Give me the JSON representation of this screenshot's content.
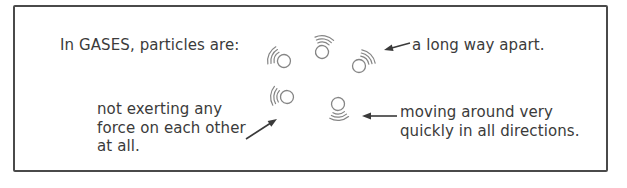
{
  "figure": {
    "title": "In GASES, particles are:",
    "labels": {
      "apart": "a long way apart.",
      "force": "not exerting any\nforce on each other\nat all.",
      "moving": "moving around very\nquickly in all directions."
    }
  },
  "colors": {
    "border": "#4a4a4a",
    "text": "#3b3b3b",
    "particle": "#858585",
    "arrow": "#3a3a3a"
  },
  "diagram": {
    "particle_radius": 6.5,
    "arc_radii": [
      10,
      13.2,
      16.4
    ],
    "particles": [
      {
        "name": "gas-particle-1",
        "cx": 284,
        "cy": 61,
        "rotation": 25
      },
      {
        "name": "gas-particle-2",
        "cx": 322,
        "cy": 52,
        "rotation": 100
      },
      {
        "name": "gas-particle-3",
        "cx": 359,
        "cy": 66,
        "rotation": 135
      },
      {
        "name": "gas-particle-4",
        "cx": 287,
        "cy": 97,
        "rotation": 5
      },
      {
        "name": "gas-particle-5",
        "cx": 338,
        "cy": 104,
        "rotation": 265
      }
    ],
    "arrows": [
      {
        "name": "arrow-a-long-way-apart",
        "x1": 410,
        "y1": 43,
        "x2": 384,
        "y2": 50
      },
      {
        "name": "arrow-not-exerting-force",
        "x1": 246,
        "y1": 139,
        "x2": 277,
        "y2": 119
      },
      {
        "name": "arrow-moving-quickly",
        "x1": 397,
        "y1": 116,
        "x2": 362,
        "y2": 116
      }
    ]
  }
}
